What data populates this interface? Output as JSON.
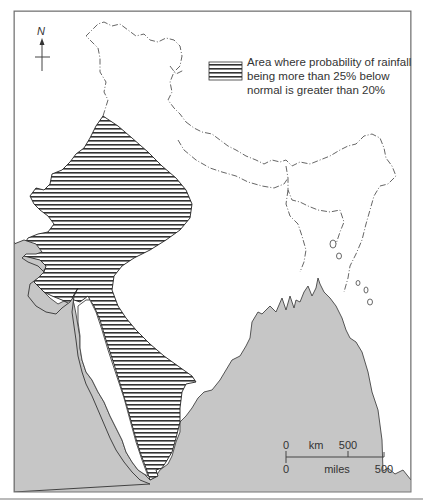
{
  "map": {
    "title": "",
    "colors": {
      "sea": "#c6c6c6",
      "land": "#ffffff",
      "outline": "#444444",
      "hatch": "#333333",
      "frame": "#777777"
    }
  },
  "legend": {
    "swatch_pattern": "horizontal-hatch",
    "lines": [
      "Area where probability of rainfall",
      "being more than 25% below",
      "normal is greater than 20%"
    ]
  },
  "compass": {
    "label": "N",
    "icon": "north-arrow-icon"
  },
  "scale_bar": {
    "top_labels": [
      {
        "text": "0",
        "x": 286
      },
      {
        "text": "km",
        "x": 316
      },
      {
        "text": "500",
        "x": 348
      }
    ],
    "bottom_labels": [
      {
        "text": "0",
        "x": 286
      },
      {
        "text": "miles",
        "x": 337
      },
      {
        "text": "500",
        "x": 384
      }
    ],
    "km_label": "km",
    "miles_label": "miles"
  }
}
